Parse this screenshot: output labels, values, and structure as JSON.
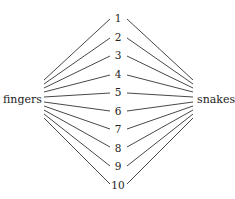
{
  "diagram": {
    "left_label": "fingers",
    "right_label": "snakes",
    "middle_labels": [
      "1",
      "2",
      "3",
      "4",
      "5",
      "6",
      "7",
      "8",
      "9",
      "10"
    ],
    "colors": {
      "line": "#333333",
      "text": "#222222",
      "background": "#ffffff"
    }
  }
}
